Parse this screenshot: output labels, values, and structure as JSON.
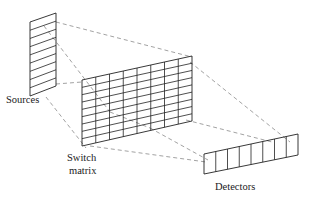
{
  "diagram": {
    "type": "optical switch architecture schematic",
    "labels": {
      "sources": "Sources",
      "switch_line1": "Switch",
      "switch_line2": "matrix",
      "detectors": "Detectors"
    },
    "components": [
      {
        "name": "Sources",
        "shape": "parallelogram strip",
        "rows": 9,
        "cols": 1
      },
      {
        "name": "Switch matrix",
        "shape": "parallelogram grid",
        "rows": 9,
        "cols": 8
      },
      {
        "name": "Detectors",
        "shape": "parallelogram strip",
        "rows": 1,
        "cols": 8
      }
    ],
    "connections": "dashed projection lines from sources through switch matrix to detectors",
    "colors": {
      "outline": "#222222",
      "dashed": "#8a8a8a",
      "background": "#ffffff"
    }
  }
}
